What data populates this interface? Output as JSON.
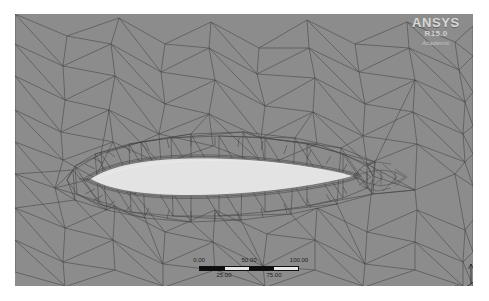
{
  "application": {
    "name": "ANSYS Meshing",
    "view_type": "mesh-display"
  },
  "logo": {
    "brand": "ANSYS",
    "release": "R15.0",
    "edition": "Academic"
  },
  "viewport": {
    "background_color": "#8d8d8d",
    "mesh_line_color": "#3a3a3a",
    "body_fill_color": "#e2e2e2",
    "geometry_name": "airfoil-cross-section",
    "mesh_type": "unstructured-triangular",
    "inflation_layers_present": true
  },
  "scale_bar": {
    "upper_ticks": [
      "0.00",
      "50.00",
      "100.00"
    ],
    "lower_ticks": [
      "25.00",
      "75.00"
    ],
    "unit": "(mm)",
    "min": 0,
    "max": 100,
    "segments": 4
  },
  "triad": {
    "axes": [
      {
        "label": "Z",
        "name": "axis-z"
      },
      {
        "label": "X",
        "name": "axis-x"
      },
      {
        "label": "Y",
        "name": "axis-y"
      }
    ]
  }
}
